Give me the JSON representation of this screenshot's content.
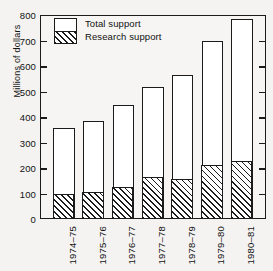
{
  "chart_data": {
    "type": "bar",
    "title": "",
    "xlabel": "",
    "ylabel": "Millions of dollars",
    "ylim": [
      0,
      800
    ],
    "ytick_step": 100,
    "yticks": [
      800,
      700,
      600,
      500,
      400,
      300,
      200,
      100,
      0
    ],
    "grid": false,
    "legend_position": "top-left",
    "categories": [
      "1974–75",
      "1975–76",
      "1976–77",
      "1977–78",
      "1978–79",
      "1979–80",
      "1980–81"
    ],
    "series": [
      {
        "name": "Total support",
        "values": [
          352,
          379,
          444,
          512,
          561,
          695,
          779
        ]
      },
      {
        "name": "Research support",
        "values": [
          90,
          98,
          118,
          157,
          148,
          202,
          218
        ]
      }
    ]
  },
  "legend": {
    "total_label": "Total support",
    "research_label": "Research support"
  },
  "colors": {
    "ink": "#1b1b1b",
    "paper": "#f4f3f1",
    "bar_fill": "#ffffff"
  }
}
